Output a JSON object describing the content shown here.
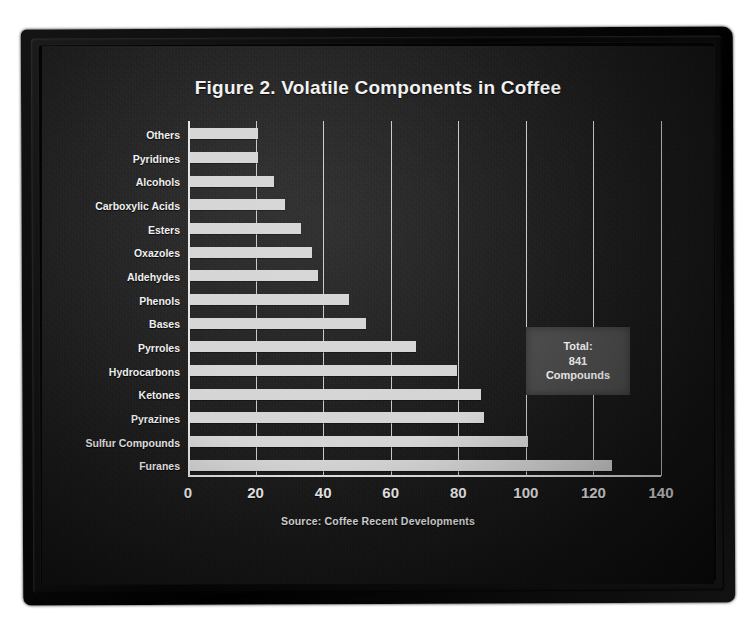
{
  "figure": {
    "title": "Figure 2. Volatile Components in Coffee",
    "source": "Source: Coffee Recent Developments",
    "callout": {
      "line1": "Total:",
      "line2": "841",
      "line3": "Compounds"
    },
    "colors": {
      "bar": "#d5d5d5",
      "background": "#1d1d1d",
      "text": "#f2f2f2",
      "gridline": "#d8d8d8",
      "callout_background": "#4b4b4b",
      "frame": "#0a0a0a"
    }
  },
  "chart_data": {
    "type": "bar",
    "orientation": "horizontal",
    "title": "Figure 2. Volatile Components in Coffee",
    "xlabel": "",
    "ylabel": "",
    "xlim": [
      0,
      140
    ],
    "xticks": [
      0,
      20,
      40,
      60,
      80,
      100,
      120,
      140
    ],
    "grid": true,
    "legend": false,
    "annotation": "Total: 841 Compounds",
    "source": "Source: Coffee Recent Developments",
    "categories": [
      "Others",
      "Pyridines",
      "Alcohols",
      "Carboxylic Acids",
      "Esters",
      "Oxazoles",
      "Aldehydes",
      "Phenols",
      "Bases",
      "Pyrroles",
      "Hydrocarbons",
      "Ketones",
      "Pyrazines",
      "Sulfur Compounds",
      "Furanes"
    ],
    "values": [
      20,
      20,
      25,
      28,
      33,
      36,
      38,
      47,
      52,
      67,
      79,
      86,
      87,
      100,
      125
    ]
  }
}
